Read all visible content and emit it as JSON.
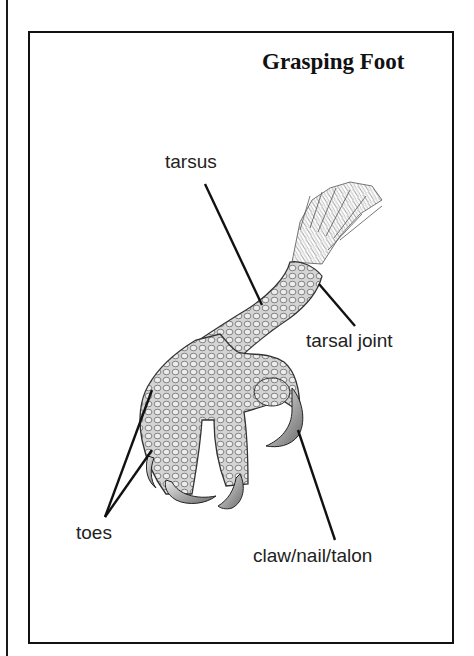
{
  "title": "Grasping Foot",
  "labels": {
    "tarsus": "tarsus",
    "tarsal_joint": "tarsal joint",
    "toes": "toes",
    "claw": "claw/nail/talon"
  },
  "colors": {
    "ink": "#111111",
    "skin_light": "#d9d9d9",
    "skin_mid": "#a8a8a8",
    "background": "#ffffff"
  }
}
